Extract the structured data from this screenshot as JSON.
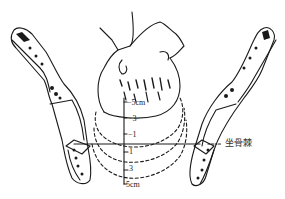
{
  "diagram": {
    "colors": {
      "line": "#1a1a1a",
      "background": "#ffffff"
    },
    "station_labels": [
      {
        "text": "−5cm",
        "y": 103
      },
      {
        "text": "−3",
        "y": 119
      },
      {
        "text": "−1",
        "y": 135
      },
      {
        "text": "1",
        "y": 152
      },
      {
        "text": "3",
        "y": 169
      },
      {
        "text": "5cm",
        "y": 185
      }
    ],
    "reference_label": "坐骨棘",
    "parts": [
      "fetal-head",
      "left-pelvic-bone",
      "right-pelvic-bone",
      "station-scale",
      "ischial-spine-line",
      "descent-curves"
    ]
  }
}
